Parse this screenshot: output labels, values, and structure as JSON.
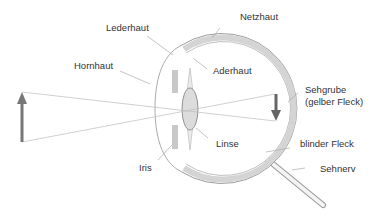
{
  "diagram": {
    "labels": {
      "lederhaut": "Lederhaut",
      "netzhaut": "Netzhaut",
      "hornhaut": "Hornhaut",
      "aderhaut": "Aderhaut",
      "sehgrube_1": "Sehgrube",
      "sehgrube_2": "(gelber Fleck)",
      "linse": "Linse",
      "blinder_fleck": "blinder Fleck",
      "iris": "Iris",
      "sehnerv": "Sehnerv"
    },
    "colors": {
      "object_arrow": "#777777",
      "image_arrow": "#666666",
      "sclera_fill": "#d6d6d6",
      "outline": "#999999",
      "iris": "#c8c8c8",
      "lens": "#dcdcdc"
    }
  }
}
